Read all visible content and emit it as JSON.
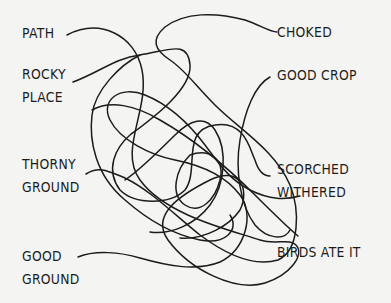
{
  "left_labels": [
    {
      "id": "path",
      "lines": [
        "PATH"
      ]
    },
    {
      "id": "rocky",
      "lines": [
        "ROCKY",
        "PLACE"
      ]
    },
    {
      "id": "thorny",
      "lines": [
        "THORNY",
        "GROUND"
      ]
    },
    {
      "id": "good_ground",
      "lines": [
        "GOOD",
        "GROUND"
      ]
    }
  ],
  "right_labels": [
    {
      "id": "choked",
      "lines": [
        "CHOKED"
      ]
    },
    {
      "id": "good_crop",
      "lines": [
        "GOOD CROP"
      ]
    },
    {
      "id": "scorched",
      "lines": [
        "SCORCHED",
        "WITHERED"
      ]
    },
    {
      "id": "birds",
      "lines": [
        "BIRDS ATE IT"
      ]
    }
  ],
  "colors": {
    "background": "#f4f4f2",
    "ink": "#1c1c1c"
  }
}
